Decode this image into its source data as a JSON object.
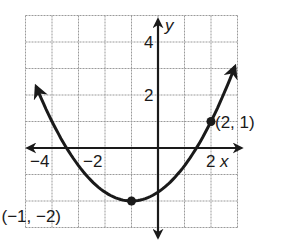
{
  "chart_data": {
    "type": "line",
    "title": "",
    "xlabel": "x",
    "ylabel": "y",
    "xlim": [
      -5,
      3
    ],
    "ylim": [
      -3,
      5
    ],
    "grid": true,
    "x_ticks": [
      {
        "value": -4,
        "label": "−4"
      },
      {
        "value": -2,
        "label": "−2"
      },
      {
        "value": 2,
        "label": "2"
      }
    ],
    "y_ticks": [
      {
        "value": 2,
        "label": "2"
      },
      {
        "value": 4,
        "label": "4"
      }
    ],
    "series": [
      {
        "name": "parabola",
        "equation": "y = (1/3)(x + 1)^2 - 2",
        "x": [
          -4.6,
          -4,
          -3,
          -2,
          -1,
          0,
          1,
          2,
          2.9
        ],
        "y": [
          2.32,
          1,
          -0.67,
          -1.67,
          -2,
          -1.67,
          -0.67,
          1,
          3.07
        ],
        "arrows": "both ends"
      }
    ],
    "points": [
      {
        "x": -1,
        "y": -2,
        "label": "(−1, −2)"
      },
      {
        "x": 2,
        "y": 1,
        "label": "(2, 1)"
      }
    ],
    "colors": {
      "curve": "#1a1a1a",
      "grid": "#9a9a9a",
      "axis": "#1a1a1a"
    }
  }
}
